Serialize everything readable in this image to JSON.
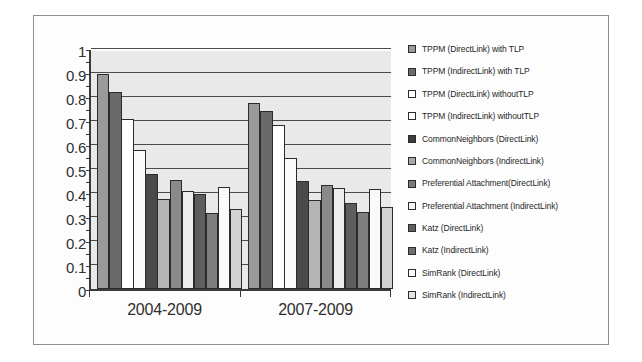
{
  "figure": {
    "kind": "grayscale-bar-chart"
  },
  "chart_data": {
    "type": "bar",
    "title": "",
    "subtitle": "",
    "xlabel": "",
    "ylabel": "",
    "ylim": [
      0,
      1
    ],
    "ytick_step": 0.1,
    "yticks": [
      "1",
      "0.9",
      "0.8",
      "0.7",
      "0.6",
      "0.5",
      "0.4",
      "0.3",
      "0.2",
      "0.1",
      "0"
    ],
    "ytick_values": [
      1,
      0.9,
      0.8,
      0.7,
      0.6,
      0.5,
      0.4,
      0.3,
      0.2,
      0.1,
      0
    ],
    "grid": true,
    "grid_axis": "y",
    "legend_position": "right",
    "categories": [
      "2004-2009",
      "2007-2009"
    ],
    "series": [
      {
        "name": "TPPM (DirectLink) with TLP",
        "color": "#9a9a9a",
        "values": [
          0.895,
          0.775
        ]
      },
      {
        "name": "TPPM (IndirectLink) with TLP",
        "color": "#6a6a6a",
        "values": [
          0.82,
          0.74
        ]
      },
      {
        "name": "TPPM (DirectLink) withoutTLP",
        "color": "#ffffff",
        "values": [
          0.71,
          0.685
        ]
      },
      {
        "name": "TPPM (IndirectLink) withoutTLP",
        "color": "#fbfbfb",
        "values": [
          0.58,
          0.545
        ]
      },
      {
        "name": "CommonNeighbors (DirectLink)",
        "color": "#4a4a4a",
        "values": [
          0.48,
          0.45
        ]
      },
      {
        "name": "CommonNeighbors (IndirectLink)",
        "color": "#b4b4b4",
        "values": [
          0.375,
          0.37
        ]
      },
      {
        "name": "Preferential Attachment (DirectLink)",
        "color": "#8a8a8a",
        "values": [
          0.455,
          0.435
        ]
      },
      {
        "name": "Preferential Attachment (IndirectLink)",
        "color": "#ededed",
        "values": [
          0.41,
          0.42
        ]
      },
      {
        "name": "Katz (DirectLink)",
        "color": "#5e5e5e",
        "values": [
          0.395,
          0.36
        ]
      },
      {
        "name": "Katz (IndirectLink)",
        "color": "#7e7e7e",
        "values": [
          0.315,
          0.32
        ]
      },
      {
        "name": "SimRank (DirectLink)",
        "color": "#fafafa",
        "values": [
          0.425,
          0.415
        ]
      },
      {
        "name": "SimRank (IndirectLink)",
        "color": "#d2d2d2",
        "values": [
          0.335,
          0.34
        ]
      }
    ],
    "legend_entries": [
      {
        "label": "TPPM (DirectLink) with TLP",
        "color": "#9a9a9a"
      },
      {
        "label": "TPPM (IndirectLink) with TLP",
        "color": "#6a6a6a"
      },
      {
        "label": "TPPM (DirectLink) withoutTLP",
        "color": "#ffffff"
      },
      {
        "label": "TPPM (IndirectLink) withoutTLP",
        "color": "#ffffff"
      },
      {
        "label": "CommonNeighbors (DirectLink)",
        "color": "#3c3c3c"
      },
      {
        "label": "CommonNeighbors (IndirectLink)",
        "color": "#a8a8a8"
      },
      {
        "label": "Preferential Attachment(DirectLink)",
        "color": "#7c7c7c"
      },
      {
        "label": "Preferential Attachment (IndirectLink)",
        "color": "#f2f2f2"
      },
      {
        "label": "Katz (DirectLink)",
        "color": "#5e5e5e"
      },
      {
        "label": "Katz (IndirectLink)",
        "color": "#6f6f6f"
      },
      {
        "label": "SimRank (DirectLink)",
        "color": "#fbfbfb"
      },
      {
        "label": "SimRank (IndirectLink)",
        "color": "#e3e3e3"
      }
    ]
  }
}
